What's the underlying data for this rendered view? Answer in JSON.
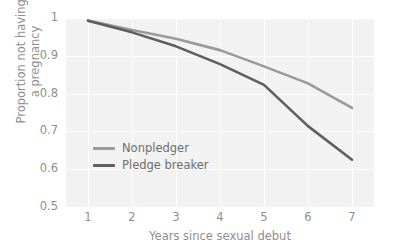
{
  "chart_data": {
    "type": "line",
    "title": "",
    "xlabel": "Years since sexual debut",
    "ylabel_line1": "Proportion not having",
    "ylabel_line2": "a pregnancy",
    "x": [
      1,
      2,
      3,
      4,
      5,
      6,
      7
    ],
    "xticklabels": [
      "1",
      "2",
      "3",
      "4",
      "5",
      "6",
      "7"
    ],
    "yticklabels": [
      "1",
      "0.9",
      "0.8",
      "0.7",
      "0.6",
      "0.5"
    ],
    "ytickvalues": [
      1,
      0.9,
      0.8,
      0.7,
      0.6,
      0.5
    ],
    "xlim": [
      0.5,
      7.5
    ],
    "ylim": [
      0.5,
      1.0
    ],
    "grid": true,
    "legend_position": "inside-left-lower",
    "background": "#f2f2f2",
    "series": [
      {
        "name": "Nonpledger",
        "color": "#9a9a9a",
        "values": [
          0.993,
          0.968,
          0.945,
          0.915,
          0.872,
          0.827,
          0.762
        ]
      },
      {
        "name": "Pledge breaker",
        "color": "#5e5e5e",
        "values": [
          0.993,
          0.962,
          0.925,
          0.878,
          0.823,
          0.714,
          0.625
        ]
      }
    ]
  },
  "axis": {
    "x_title": "Years since sexual debut",
    "y_title_line1": "Proportion not having",
    "y_title_line2": "a pregnancy"
  },
  "legend": {
    "items": [
      {
        "label": "Nonpledger",
        "color": "#9a9a9a"
      },
      {
        "label": "Pledge breaker",
        "color": "#5e5e5e"
      }
    ]
  },
  "colors": {
    "panel": "#f2f2f2",
    "grid": "#ffffff",
    "tick_text": "#8f8f8f",
    "legend_text": "#6e6e6e",
    "series_light": "#9a9a9a",
    "series_dark": "#5e5e5e"
  }
}
